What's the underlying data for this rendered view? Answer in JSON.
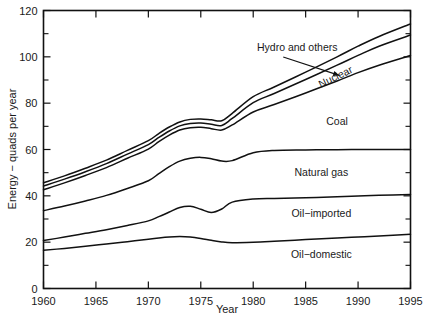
{
  "chart_data": {
    "type": "area",
    "title": "",
    "xlabel": "Year",
    "ylabel": "Energy - quads per year",
    "xlim": [
      1960,
      1995
    ],
    "ylim": [
      0,
      120
    ],
    "xticks": [
      1960,
      1965,
      1970,
      1975,
      1980,
      1985,
      1990,
      1995
    ],
    "yticks": [
      0,
      20,
      40,
      60,
      80,
      100,
      120
    ],
    "yticks_minor": [
      10,
      30,
      50,
      70,
      90,
      110
    ],
    "grid": false,
    "legend_position": "inline-annotations",
    "x": [
      1960,
      1962,
      1964,
      1966,
      1968,
      1970,
      1971,
      1972,
      1973,
      1974,
      1975,
      1976,
      1977,
      1978,
      1980,
      1982,
      1985,
      1988,
      1990,
      1992,
      1995
    ],
    "series": [
      {
        "name": "Oil-domestic",
        "label": "Oil−domestic",
        "values": [
          16.5,
          17.3,
          18.2,
          19.2,
          20.2,
          21.3,
          21.8,
          22.2,
          22.4,
          22.2,
          21.6,
          20.8,
          20.1,
          19.8,
          20.0,
          20.4,
          21.1,
          21.8,
          22.2,
          22.7,
          23.4
        ]
      },
      {
        "name": "Oil-imported",
        "label": "Oil−imported",
        "values": [
          20.7,
          22.2,
          23.8,
          25.4,
          27.2,
          29.2,
          31.0,
          33.0,
          35.0,
          35.5,
          34.2,
          32.8,
          34.3,
          37.3,
          38.6,
          38.9,
          39.2,
          39.6,
          39.9,
          40.2,
          40.6
        ]
      },
      {
        "name": "Natural gas",
        "label": "Natural gas",
        "values": [
          33.6,
          35.6,
          37.8,
          40.2,
          43.2,
          46.5,
          49.6,
          52.6,
          55.0,
          56.2,
          56.6,
          56.0,
          55.0,
          55.2,
          58.6,
          59.6,
          59.8,
          59.9,
          60.0,
          60.0,
          60.0
        ]
      },
      {
        "name": "Coal",
        "label": "Coal",
        "values": [
          42.6,
          45.6,
          48.8,
          52.2,
          56.2,
          60.2,
          63.4,
          66.2,
          68.4,
          69.4,
          69.6,
          69.0,
          68.4,
          70.6,
          76.2,
          79.4,
          84.4,
          89.6,
          93.2,
          96.4,
          100.6
        ]
      },
      {
        "name": "Nuclear",
        "label": "Nuclear",
        "values": [
          44.2,
          47.2,
          50.4,
          53.9,
          58.0,
          62.1,
          65.2,
          68.0,
          70.2,
          71.2,
          71.4,
          70.9,
          70.4,
          73.4,
          80.2,
          84.2,
          90.2,
          96.4,
          100.6,
          104.6,
          109.4
        ]
      },
      {
        "name": "Hydro and others",
        "label": "Hydro and others",
        "values": [
          45.6,
          48.6,
          51.9,
          55.4,
          59.6,
          63.8,
          66.9,
          69.7,
          71.9,
          73.0,
          73.2,
          72.8,
          72.4,
          75.6,
          82.8,
          87.0,
          93.4,
          100.0,
          104.6,
          108.8,
          114.2
        ]
      }
    ],
    "annotations": [
      {
        "name": "hydro-and-others",
        "text": "Hydro and others",
        "x": 1984.2,
        "y": 102.5,
        "rotation": 0,
        "has_leader": true
      },
      {
        "name": "nuclear",
        "text": "Nuclear",
        "x": 1988.0,
        "y": 90.0,
        "rotation": -26,
        "has_leader": false
      },
      {
        "name": "coal",
        "text": "Coal",
        "x": 1988.0,
        "y": 70.5,
        "rotation": 0,
        "has_leader": false
      },
      {
        "name": "natural-gas",
        "text": "Natural gas",
        "x": 1986.5,
        "y": 48.5,
        "rotation": 0,
        "has_leader": false
      },
      {
        "name": "oil-imported",
        "text": "Oil−imported",
        "x": 1986.5,
        "y": 31.0,
        "rotation": 0,
        "has_leader": false
      },
      {
        "name": "oil-domestic",
        "text": "Oil−domestic",
        "x": 1986.5,
        "y": 13.0,
        "rotation": 0,
        "has_leader": false
      }
    ]
  },
  "axes": {
    "y_title": "Energy − quads per year",
    "x_title": "Year",
    "x_tick_labels": [
      "1960",
      "1965",
      "1970",
      "1975",
      "1980",
      "1985",
      "1990",
      "1995"
    ],
    "y_tick_labels": [
      "0",
      "20",
      "40",
      "60",
      "80",
      "100",
      "120"
    ]
  },
  "colors": {
    "line": "#111111",
    "background": "#ffffff",
    "text": "#1a1a1a"
  }
}
